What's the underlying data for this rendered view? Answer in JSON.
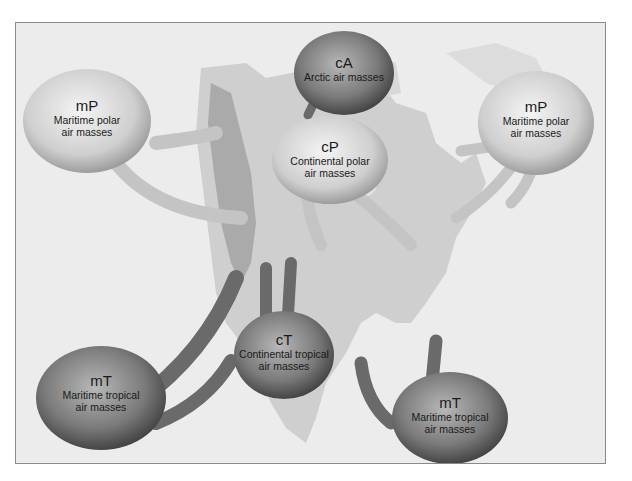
{
  "figure": {
    "colors": {
      "background": "#ececec",
      "land": "#c9c9c9",
      "mountains": "#9a9a9a",
      "light_bubble": "#d6d6d6",
      "dark_bubble": "#6f6f6f",
      "light_arrow": "#c4c4c4",
      "dark_arrow": "#6a6a6a",
      "frame_border": "#8a8a8a"
    }
  },
  "air_masses": [
    {
      "id": "mp-west",
      "code": "mP",
      "line1": "Maritime polar",
      "line2": "air masses",
      "tone": "light"
    },
    {
      "id": "ca",
      "code": "cA",
      "line1": "Arctic air masses",
      "line2": "",
      "tone": "dark"
    },
    {
      "id": "cp",
      "code": "cP",
      "line1": "Continental polar",
      "line2": "air masses",
      "tone": "light"
    },
    {
      "id": "mp-east",
      "code": "mP",
      "line1": "Maritime polar",
      "line2": "air masses",
      "tone": "light"
    },
    {
      "id": "ct",
      "code": "cT",
      "line1": "Continental tropical",
      "line2": "air masses",
      "tone": "dark"
    },
    {
      "id": "mt-west",
      "code": "mT",
      "line1": "Maritime tropical",
      "line2": "air masses",
      "tone": "dark"
    },
    {
      "id": "mt-east",
      "code": "mT",
      "line1": "Maritime tropical",
      "line2": "air masses",
      "tone": "dark"
    }
  ]
}
